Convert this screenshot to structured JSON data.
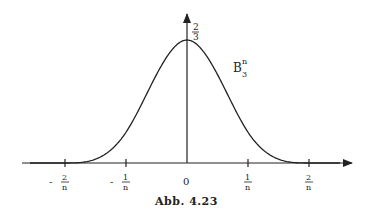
{
  "figure": {
    "caption": "Abb. 4.23",
    "curve_label": {
      "base": "B",
      "sub": "3",
      "sup": "n"
    },
    "y_axis_top_label": {
      "num": "2",
      "den": "3"
    },
    "x_ticks": [
      {
        "sign": "-",
        "num": "2",
        "den": "n"
      },
      {
        "sign": "-",
        "num": "1",
        "den": "n"
      },
      {
        "plain": "0"
      },
      {
        "sign": "",
        "num": "1",
        "den": "n"
      },
      {
        "sign": "",
        "num": "2",
        "den": "n"
      }
    ],
    "colors": {
      "ink": "#222222",
      "background": "#ffffff"
    }
  },
  "chart_data": {
    "type": "line",
    "title": "Abb. 4.23",
    "series": [
      {
        "name": "B_3^n",
        "description": "Cubic B-spline bump, support [-2/n, 2/n], peak 2/3 at 0",
        "x": [
          "-2/n",
          "-1/n",
          "0",
          "1/n",
          "2/n"
        ],
        "y": [
          0,
          0.1667,
          0.6667,
          0.1667,
          0
        ]
      }
    ],
    "xlabel": "",
    "ylabel": "",
    "ylim": [
      0,
      0.6667
    ],
    "grid": false
  }
}
